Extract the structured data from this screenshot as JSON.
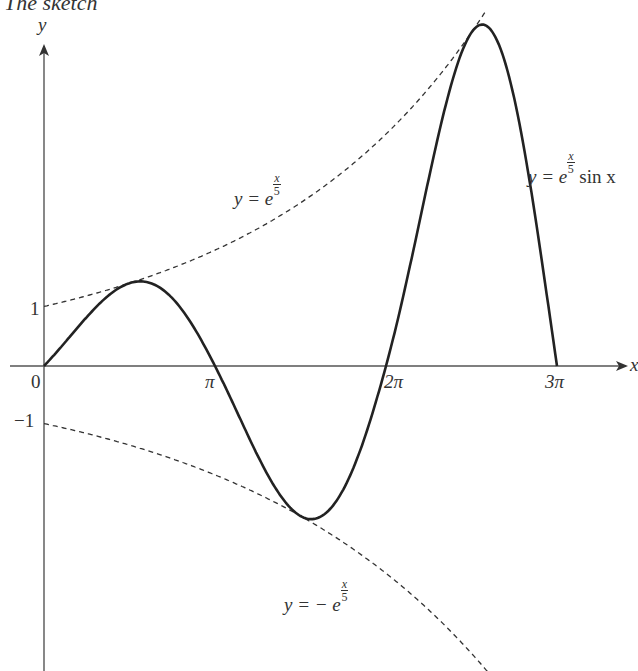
{
  "title": "The sketch",
  "chart_data": {
    "type": "line",
    "title": "The sketch",
    "xlabel": "x",
    "ylabel": "y",
    "x_ticks": [
      "0",
      "π",
      "2π",
      "3π"
    ],
    "y_ticks": [
      "1",
      "−1"
    ],
    "xlim": [
      0,
      9.42
    ],
    "grid": false,
    "legend": "none",
    "series": [
      {
        "name": "y = e^(x/5) sin x",
        "style": "solid",
        "function": "exp(x/5)*sin(x)",
        "x": [
          0,
          1.57,
          3.14,
          4.71,
          6.28,
          7.85,
          9.42
        ],
        "values": [
          0,
          1.37,
          0,
          -2.56,
          0,
          4.81,
          0
        ]
      },
      {
        "name": "y = e^(x/5)",
        "style": "dashed",
        "function": "exp(x/5)",
        "x": [
          0,
          3.14,
          6.28,
          9.42
        ],
        "values": [
          1,
          1.87,
          3.51,
          6.59
        ]
      },
      {
        "name": "y = − e^(x/5)",
        "style": "dashed",
        "function": "-exp(x/5)",
        "x": [
          0,
          3.14,
          6.28,
          9.42
        ],
        "values": [
          -1,
          -1.87,
          -3.51,
          -6.59
        ]
      }
    ],
    "annotations": [
      "y = e^(x/5)",
      "y = e^(x/5) sin x",
      "y = − e^(x/5)"
    ]
  },
  "labels": {
    "y_axis": "y",
    "x_axis": "x",
    "origin": "0",
    "pi": "π",
    "two_pi": "2π",
    "three_pi": "3π",
    "one": "1",
    "minus_one": "−1",
    "upper_env_prefix": "y = e",
    "curve_prefix": "y = e",
    "curve_suffix": " sin x",
    "lower_env_prefix": "y = − e",
    "frac_num": "x",
    "frac_den": "5"
  }
}
